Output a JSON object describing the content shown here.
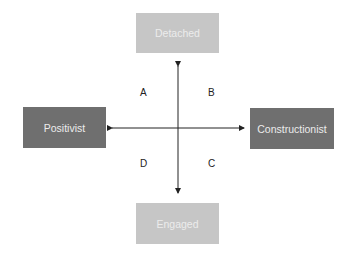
{
  "diagram": {
    "nodes": {
      "top": {
        "label": "Detached",
        "color": "#c6c6c6"
      },
      "bottom": {
        "label": "Engaged",
        "color": "#c6c6c6"
      },
      "left": {
        "label": "Positivist",
        "color": "#6f6f6f"
      },
      "right": {
        "label": "Constructionist",
        "color": "#6f6f6f"
      }
    },
    "quadrants": {
      "top_left": "A",
      "top_right": "B",
      "bottom_right": "C",
      "bottom_left": "D"
    },
    "axes": [
      {
        "from": "Detached",
        "to": "Engaged",
        "type": "double-arrow",
        "orientation": "vertical"
      },
      {
        "from": "Positivist",
        "to": "Constructionist",
        "type": "double-arrow",
        "orientation": "horizontal"
      }
    ]
  }
}
